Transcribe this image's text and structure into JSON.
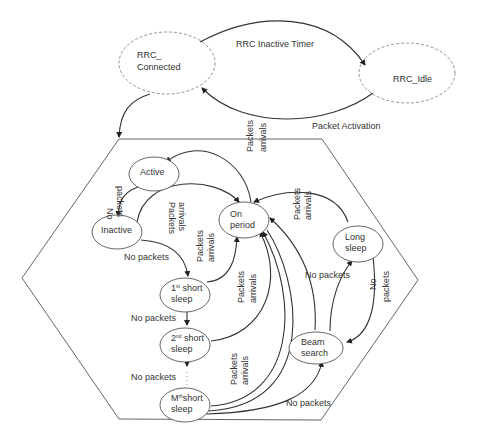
{
  "diagram": {
    "type": "state-diagram",
    "top_states": [
      {
        "id": "rrc_connected",
        "line1": "RRC_",
        "line2": "Connected"
      },
      {
        "id": "rrc_idle",
        "label": "RRC_Idle"
      }
    ],
    "top_transitions": [
      {
        "from": "rrc_connected",
        "to": "rrc_idle",
        "label": "RRC Inactive Timer"
      },
      {
        "from": "rrc_idle",
        "to": "rrc_connected",
        "label": "Packet Activation"
      }
    ],
    "inner_states": {
      "active": {
        "label": "Active"
      },
      "inactive": {
        "label": "Inactive"
      },
      "on_period": {
        "line1": "On",
        "line2": "period"
      },
      "short1": {
        "line1_pre": "1",
        "line1_sup": "st",
        "line1_post": " short",
        "line2": "sleep"
      },
      "short2": {
        "line1_pre": "2",
        "line1_sup": "nd",
        "line1_post": " short",
        "line2": "sleep"
      },
      "shortM": {
        "line1_pre": "M",
        "line1_sup": "th",
        "line1_post": "short",
        "line2": "sleep"
      },
      "long_sleep": {
        "line1": "Long",
        "line2": "sleep"
      },
      "beam_search": {
        "line1": "Beam",
        "line2": "search"
      }
    },
    "edge_labels": {
      "no_packets": "No packets",
      "no": "No",
      "packets": "packets",
      "packets_word": "Packets",
      "arrivals": "arrivals",
      "ellipsis": "⋮"
    },
    "inner_transitions": [
      {
        "from": "active",
        "to": "inactive",
        "label": "No packets"
      },
      {
        "from": "inactive",
        "to": "on_period",
        "label": "Packets arrivals"
      },
      {
        "from": "on_period",
        "to": "active",
        "label": "Packets arrivals"
      },
      {
        "from": "inactive",
        "to": "short1",
        "label": "No packets"
      },
      {
        "from": "short1",
        "to": "on_period",
        "label": "Packets arrivals"
      },
      {
        "from": "short1",
        "to": "short2",
        "label": "No packets"
      },
      {
        "from": "short2",
        "to": "on_period",
        "label": "Packets arrivals"
      },
      {
        "from": "short2",
        "to": "shortM",
        "label": "No packets"
      },
      {
        "from": "shortM",
        "to": "on_period",
        "label": "Packets arrivals"
      },
      {
        "from": "shortM",
        "to": "beam_search",
        "label": "No packets"
      },
      {
        "from": "beam_search",
        "to": "long_sleep",
        "label": "No packets"
      },
      {
        "from": "long_sleep",
        "to": "beam_search",
        "label": "No packets"
      },
      {
        "from": "long_sleep",
        "to": "on_period",
        "label": "Packets arrivals"
      },
      {
        "from": "beam_search",
        "to": "on_period",
        "label": ""
      }
    ]
  }
}
